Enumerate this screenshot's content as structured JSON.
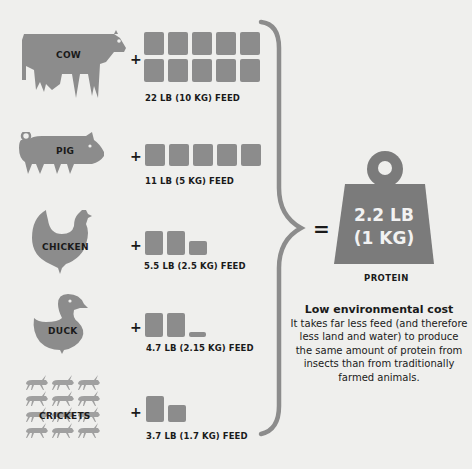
{
  "colors": {
    "background": "#efefed",
    "shape_gray": "#8c8c8c",
    "weight_gray": "#7b7b7b",
    "text": "#1a1a1a",
    "weight_text": "#f2f2f2"
  },
  "rows": [
    {
      "animal": "COW",
      "icon": "cow-icon",
      "feed_label": "22 LB (10 KG) FEED",
      "bags": 10
    },
    {
      "animal": "PIG",
      "icon": "pig-icon",
      "feed_label": "11 LB (5 KG) FEED",
      "bags": 5
    },
    {
      "animal": "CHICKEN",
      "icon": "chicken-icon",
      "feed_label": "5.5 LB (2.5 KG) FEED",
      "bags": 2.5
    },
    {
      "animal": "DUCK",
      "icon": "duck-icon",
      "feed_label": "4.7 LB (2.15 KG) FEED",
      "bags": 2.15
    },
    {
      "animal": "CRICKETS",
      "icon": "crickets-icon",
      "feed_label": "3.7 LB (1.7 KG) FEED",
      "bags": 1.7
    }
  ],
  "operators": {
    "plus": "+",
    "equals": "="
  },
  "result": {
    "weight_line1": "2.2 LB",
    "weight_line2": "(1 KG)",
    "label": "PROTEIN"
  },
  "note": {
    "title": "Low environmental cost",
    "body": "It takes far less feed (and therefore less land and water) to produce the same amount of protein from insects than from traditionally farmed animals."
  }
}
